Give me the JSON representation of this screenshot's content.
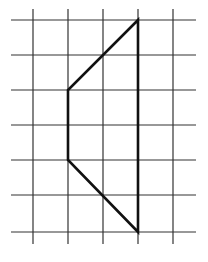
{
  "diagram": {
    "type": "grid-figure",
    "background": "#ffffff",
    "grid": {
      "color": "#333333",
      "stroke_width": 1.2,
      "vertical_lines_x": [
        33,
        68,
        103,
        138,
        173
      ],
      "horizontal_lines_y": [
        20,
        55,
        90,
        125,
        160,
        195,
        232
      ],
      "extent": {
        "x_min": 11,
        "x_max": 196,
        "y_min": 9,
        "y_max": 244
      }
    },
    "shape": {
      "color": "#111111",
      "stroke_width": 2.6,
      "vertices": [
        [
          138,
          20
        ],
        [
          68,
          90
        ],
        [
          68,
          160
        ],
        [
          138,
          232
        ]
      ],
      "closed": true,
      "description": "Trapezoid drawn on square grid: right side vertical, left side vertical, two slanted edges"
    }
  }
}
